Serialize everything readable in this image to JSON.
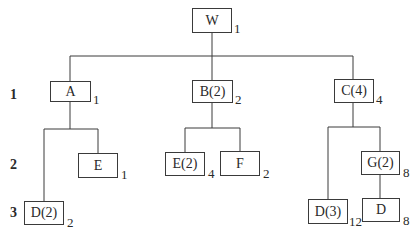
{
  "diagram": {
    "type": "product-structure-tree",
    "level_labels": [
      "1",
      "2",
      "3"
    ],
    "nodes": {
      "W": {
        "label": "W",
        "qty": "1"
      },
      "A": {
        "label": "A",
        "qty": "1"
      },
      "B": {
        "label": "B(2)",
        "qty": "2"
      },
      "C": {
        "label": "C(4)",
        "qty": "4"
      },
      "E1": {
        "label": "E",
        "qty": "1"
      },
      "D1": {
        "label": "D(2)",
        "qty": "2"
      },
      "E2": {
        "label": "E(2)",
        "qty": "4"
      },
      "F": {
        "label": "F",
        "qty": "2"
      },
      "D3": {
        "label": "D(3)",
        "qty": "12"
      },
      "G": {
        "label": "G(2)",
        "qty": "8"
      },
      "D4": {
        "label": "D",
        "qty": "8"
      }
    },
    "edges": [
      [
        "W",
        "A"
      ],
      [
        "W",
        "B"
      ],
      [
        "W",
        "C"
      ],
      [
        "A",
        "D1"
      ],
      [
        "A",
        "E1"
      ],
      [
        "B",
        "E2"
      ],
      [
        "B",
        "F"
      ],
      [
        "C",
        "D3"
      ],
      [
        "C",
        "G"
      ],
      [
        "G",
        "D4"
      ]
    ]
  }
}
